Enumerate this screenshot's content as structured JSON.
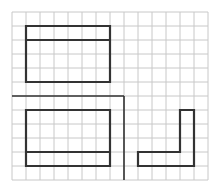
{
  "diagram": {
    "type": "grid-figure-puzzle",
    "grid": {
      "origin_x": 12,
      "origin_y": 12,
      "cell_size": 14,
      "columns": 14,
      "rows": 12,
      "line_color": "#c8c8c8"
    },
    "stroke_color": "#333333",
    "dividers": [
      {
        "name": "horizontal-divider",
        "points": [
          [
            0,
            6
          ],
          [
            8,
            6
          ]
        ]
      },
      {
        "name": "vertical-divider",
        "points": [
          [
            8,
            6
          ],
          [
            8,
            12
          ]
        ]
      }
    ],
    "figures": [
      {
        "name": "top-rectangle",
        "outline": [
          [
            1,
            1
          ],
          [
            7,
            1
          ],
          [
            7,
            5
          ],
          [
            1,
            5
          ]
        ],
        "inner_lines": [
          [
            [
              1,
              2
            ],
            [
              7,
              2
            ]
          ]
        ]
      },
      {
        "name": "bottom-left-rectangle",
        "outline": [
          [
            1,
            7
          ],
          [
            7,
            7
          ],
          [
            7,
            11
          ],
          [
            1,
            11
          ]
        ],
        "inner_lines": [
          [
            [
              1,
              10
            ],
            [
              7,
              10
            ]
          ]
        ]
      },
      {
        "name": "l-shape",
        "outline": [
          [
            12,
            7
          ],
          [
            13,
            7
          ],
          [
            13,
            11
          ],
          [
            9,
            11
          ],
          [
            9,
            10
          ],
          [
            12,
            10
          ]
        ],
        "inner_lines": []
      }
    ]
  }
}
